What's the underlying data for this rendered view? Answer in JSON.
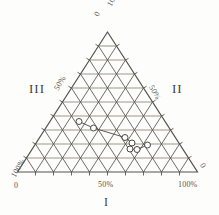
{
  "figure": {
    "name": "ternary-diagram",
    "background_color": "#fdfdfc",
    "line_color": "#55534d",
    "gridline_horizontal_color": "#8c8a77",
    "marker_edge_color": "#4a4842",
    "marker_fill_color": "#ffffff"
  },
  "labels": {
    "apex_zero": "0",
    "apex_hundred": "100%",
    "left_mid": "50%",
    "right_mid": "50%",
    "bottom_left_hundred": "100%",
    "bottom_left_zero": "0",
    "bottom_mid": "50%",
    "bottom_right_hundred": "100%",
    "bottom_right_zero": "0",
    "region_left": "III",
    "region_right": "II",
    "axis_bottom": "I"
  },
  "chart_data": {
    "type": "scatter",
    "plot_kind": "ternary",
    "title": "",
    "xlabel": "I",
    "components": [
      "I",
      "II",
      "III"
    ],
    "axis_ranges": {
      "I": [
        0,
        100
      ],
      "II": [
        0,
        100
      ],
      "III": [
        0,
        100
      ]
    },
    "grid": true,
    "grid_divisions": 10,
    "tick_labels": {
      "bottom": [
        "0",
        "50%",
        "100%"
      ],
      "right": [
        "0",
        "50%",
        "100%"
      ],
      "left": [
        "0",
        "50%",
        "100%"
      ]
    },
    "legend": "none",
    "series": [
      {
        "name": "path",
        "connected": true,
        "marker": "open-circle",
        "points": [
          {
            "I": 30,
            "II": 20,
            "III": 50
          },
          {
            "I": 40,
            "II": 20,
            "III": 40
          },
          {
            "I": 60,
            "II": 20,
            "III": 20
          },
          {
            "I": 65,
            "II": 22,
            "III": 13
          },
          {
            "I": 63,
            "II": 27,
            "III": 10
          },
          {
            "I": 67,
            "II": 26,
            "III": 7
          },
          {
            "I": 73,
            "II": 22,
            "III": 5
          }
        ]
      }
    ]
  },
  "geometry": {
    "apex": [
      107.5,
      32
    ],
    "bottom_left": [
      17.5,
      172
    ],
    "bottom_right": [
      197.5,
      172
    ],
    "markers_px": [
      [
        79.0,
        121.5
      ],
      [
        93.5,
        128.0
      ],
      [
        125.0,
        137.5
      ],
      [
        132.0,
        143.0
      ],
      [
        130.0,
        149.0
      ],
      [
        137.0,
        149.5
      ],
      [
        147.5,
        145.0
      ]
    ]
  }
}
